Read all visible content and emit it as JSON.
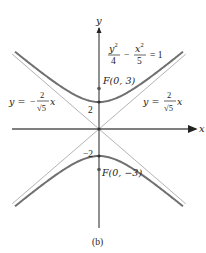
{
  "figure": {
    "caption": "(b)",
    "equation": {
      "y_term_num": "y",
      "y_term_exp": "2",
      "y_term_den": "4",
      "minus": "−",
      "x_term_num": "x",
      "x_term_exp": "2",
      "x_term_den": "5",
      "equals": "= 1",
      "a_squared": 4,
      "b_squared": 5
    },
    "axes": {
      "x_label": "x",
      "y_label": "y"
    },
    "vertex_labels": {
      "upper": "2",
      "lower": "−2"
    },
    "foci": [
      {
        "label": "F(0, 3)",
        "x": 0,
        "y": 3
      },
      {
        "label": "F(0, −3)",
        "x": 0,
        "y": -3
      }
    ],
    "vertices": [
      {
        "x": 0,
        "y": 2
      },
      {
        "x": 0,
        "y": -2
      }
    ],
    "asymptotes": [
      {
        "lhs": "y =",
        "sign": "−",
        "num": "2",
        "den": "√5",
        "var": "x",
        "slope": -0.8944
      },
      {
        "lhs": "y =",
        "sign": "",
        "num": "2",
        "den": "√5",
        "var": "x",
        "slope": 0.8944
      }
    ],
    "colors": {
      "hyperbola": "#6e6e6e",
      "asymptote": "#b0b0b0",
      "axis": "#222222",
      "text": "#222222"
    }
  }
}
